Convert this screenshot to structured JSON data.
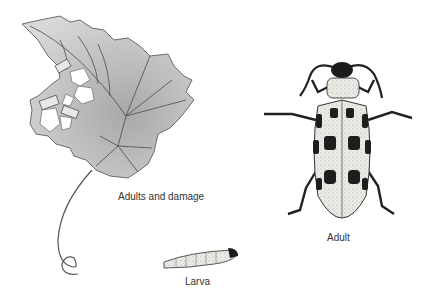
{
  "figure": {
    "labels": {
      "damage": "Adults and damage",
      "adult": "Adult",
      "larva": "Larva"
    },
    "colors": {
      "background": "#ffffff",
      "leaf_fill": "#c9c9c9",
      "leaf_stroke": "#6b6b6b",
      "beetle_body": "#e6e6e0",
      "beetle_spots": "#1e1e1e",
      "caption_text": "#333333"
    }
  }
}
